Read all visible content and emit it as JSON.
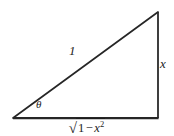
{
  "figure": {
    "name": "right-triangle-trig-diagram",
    "background_color": "#ffffff",
    "width": 174,
    "height": 136,
    "stroke_color": "#262626",
    "label_color": "#1c1c1c"
  },
  "geometry": {
    "vertices": {
      "left": {
        "x": 13,
        "y": 118
      },
      "bottom_right": {
        "x": 158,
        "y": 118
      },
      "top_right": {
        "x": 158,
        "y": 12
      }
    },
    "sides": [
      {
        "name": "base",
        "from": "left",
        "to": "bottom_right",
        "stroke_width": 2.2
      },
      {
        "name": "vertical",
        "from": "bottom_right",
        "to": "top_right",
        "stroke_width": 1.7
      },
      {
        "name": "hypotenuse",
        "from": "top_right",
        "to": "left",
        "stroke_width": 1.7
      }
    ]
  },
  "labels": {
    "hypotenuse": "1",
    "opposite": "x",
    "angle": "θ",
    "adjacent": {
      "radical_sign": "√",
      "radicand_one": "1",
      "radicand_minus": "−",
      "radicand_var": "x",
      "radicand_exponent": "2",
      "full_text": "√(1 − x²)"
    }
  }
}
